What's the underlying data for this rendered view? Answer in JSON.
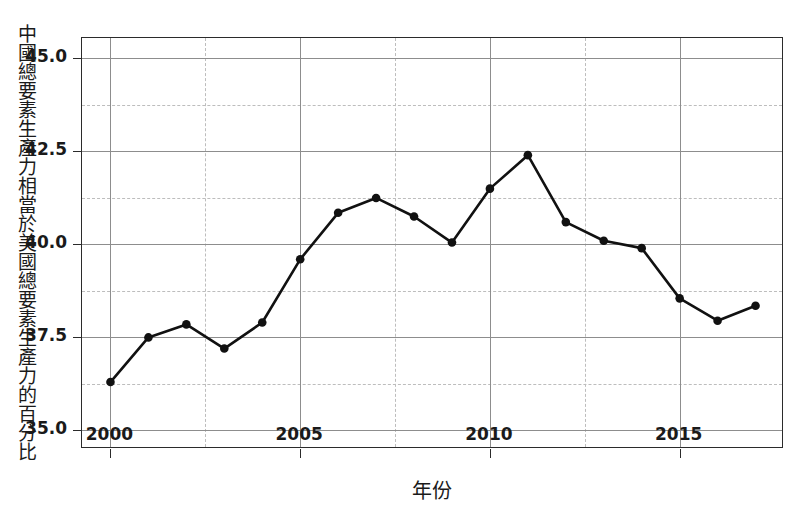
{
  "chart_data": {
    "type": "line",
    "title": "",
    "xlabel": "年份",
    "ylabel": "中國總要素生產力相當於美國總要素生產力的百分比",
    "xlim": [
      1999.25,
      2017.75
    ],
    "ylim": [
      34.5,
      45.55
    ],
    "grid": true,
    "legend": null,
    "x_ticks": [
      "2000",
      "2005",
      "2010",
      "2015"
    ],
    "x_tick_values": [
      2000,
      2005,
      2010,
      2015
    ],
    "y_ticks": [
      "35.0",
      "37.5",
      "40.0",
      "42.5",
      "45.0"
    ],
    "y_tick_values": [
      35.0,
      37.5,
      40.0,
      42.5,
      45.0
    ],
    "y_minor_values": [
      36.25,
      38.75,
      41.25,
      43.75
    ],
    "x_minor_values": [
      2002.5,
      2007.5,
      2012.5
    ],
    "marker": "filled-circle",
    "line_color": "#111111",
    "marker_color": "#111111",
    "x": [
      2000,
      2001,
      2002,
      2003,
      2004,
      2005,
      2006,
      2007,
      2008,
      2009,
      2010,
      2011,
      2012,
      2013,
      2014,
      2015,
      2016,
      2017
    ],
    "values": [
      36.3,
      37.5,
      37.85,
      37.2,
      37.9,
      39.6,
      40.85,
      41.25,
      40.75,
      40.05,
      41.5,
      42.4,
      40.6,
      40.1,
      39.9,
      38.55,
      37.95,
      38.35
    ],
    "series": [
      {
        "name": "中國總要素生產力相當於美國的百分比",
        "values": [
          36.3,
          37.5,
          37.85,
          37.2,
          37.9,
          39.6,
          40.85,
          41.25,
          40.75,
          40.05,
          41.5,
          42.4,
          40.6,
          40.1,
          39.9,
          38.55,
          37.95,
          38.35
        ]
      }
    ]
  },
  "axis": {
    "y_title": "中國總要素生產力相當於美國總要素生產力的百分比",
    "x_title": "年份"
  },
  "colors": {
    "frame": "#2b2b2b",
    "grid_major": "#8d8d8d",
    "grid_minor": "#bdbdbd",
    "line": "#111111",
    "text": "#1a1a1a",
    "background": "#ffffff"
  }
}
